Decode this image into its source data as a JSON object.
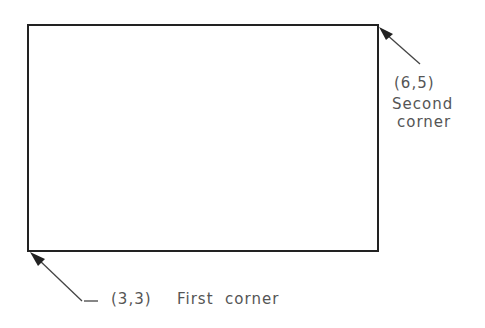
{
  "diagram": {
    "rectangle": {
      "x1": 28,
      "y1": 25,
      "x2": 378,
      "y2": 251,
      "stroke": "#222222"
    },
    "second_corner": {
      "coords": "(6,5)",
      "label_line1": "Second",
      "label_line2": "corner"
    },
    "first_corner": {
      "coords": "(3,3)",
      "label": "First  corner"
    }
  }
}
